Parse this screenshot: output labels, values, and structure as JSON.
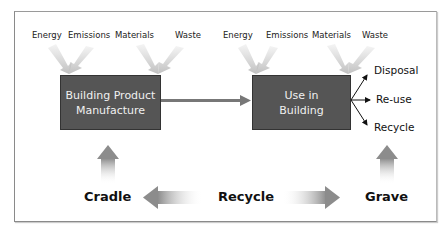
{
  "diagram": {
    "left_inputs": [
      "Energy",
      "Emissions",
      "Materials",
      "Waste"
    ],
    "right_inputs": [
      "Energy",
      "Emissions",
      "Materials",
      "Waste"
    ],
    "box_manufacture": {
      "line1": "Building Product",
      "line2": "Manufacture"
    },
    "box_use": {
      "line1": "Use in",
      "line2": "Building"
    },
    "outcomes": [
      "Disposal",
      "Re-use",
      "Recycle"
    ],
    "stages": {
      "cradle": "Cradle",
      "recycle": "Recycle",
      "grave": "Grave"
    },
    "colors": {
      "box": "#555555",
      "arrow_gray": "#8c8c8c",
      "text": "#111111"
    }
  }
}
